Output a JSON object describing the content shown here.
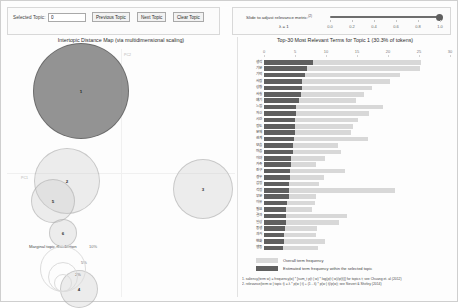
{
  "toolbar": {
    "selected_topic_label": "Selected Topic:",
    "selected_topic_value": "0",
    "previous_topic": "Previous Topic",
    "next_topic": "Next Topic",
    "clear_topic": "Clear Topic"
  },
  "slider": {
    "label": "Slide to adjust relevance metric:",
    "label_sup": "(2)",
    "lambda_text": "λ = 1",
    "value": 1.0,
    "min": 0.0,
    "max": 1.0,
    "ticks": [
      "0.0",
      "0.2",
      "0.4",
      "0.6",
      "0.8",
      "1.0"
    ]
  },
  "left_panel": {
    "title": "Intertopic Distance Map (via multidimensional scaling)",
    "axis_labels": {
      "pc1": "PC1",
      "pc2": "PC2"
    },
    "marginal_legend": {
      "title": "Marginal topic distribution",
      "sizes": [
        "2%",
        "5%",
        "10%"
      ]
    },
    "topics": [
      {
        "id": "1",
        "x": 74,
        "y": 42,
        "r": 48,
        "selected": true
      },
      {
        "id": "2",
        "x": 60,
        "y": 132,
        "r": 33,
        "selected": false
      },
      {
        "id": "3",
        "x": 196,
        "y": 140,
        "r": 30,
        "selected": false
      },
      {
        "id": "5",
        "x": 46,
        "y": 152,
        "r": 22,
        "selected": false
      },
      {
        "id": "6",
        "x": 56,
        "y": 184,
        "r": 14,
        "selected": false
      },
      {
        "id": "4",
        "x": 72,
        "y": 240,
        "r": 19,
        "selected": false
      }
    ]
  },
  "right_panel": {
    "title": "Top-30 Most Relevant Terms for Topic 1 (30.3% of tokens)",
    "topic_number": 1,
    "token_share": "30.3%",
    "legend": {
      "overall": "Overall term frequency",
      "within": "Estimated term frequency within the selected topic"
    },
    "notes": [
      "1. saliency(term w) = frequency(w) * [sum_t p(t | w) * log(p(t | w)/p(t))] for topics t; see Chuang et. al (2012)",
      "2. relevance(term w | topic t) = λ * p(w | t) + (1 - λ) * p(w | t)/p(w); see Sievert & Shirley (2014)"
    ]
  },
  "chart_data": {
    "type": "bar",
    "title": "Top-30 Most Relevant Terms for Topic 1 (30.3% of tokens)",
    "xlabel": "",
    "ylabel": "",
    "xlim": [
      0,
      30
    ],
    "grid": false,
    "legend_position": "bottom",
    "orientation": "horizontal",
    "ticks": [
      0,
      5,
      10,
      15,
      20,
      25,
      30
    ],
    "categories": [
      "생각",
      "기분",
      "기억",
      "사람",
      "상황",
      "사실",
      "얘기",
      "느낌",
      "자신",
      "시간",
      "정도",
      "문제",
      "관계",
      "모습",
      "마음",
      "이야",
      "가족",
      "친구",
      "경우",
      "감정",
      "걱정",
      "부분",
      "이유",
      "필요",
      "결과",
      "일상",
      "동생",
      "과거",
      "변화",
      "행동"
    ],
    "series": [
      {
        "name": "Overall term frequency",
        "values": [
          25.4,
          25.1,
          21.9,
          20.3,
          17.4,
          16.1,
          14.8,
          19.2,
          16.9,
          15.1,
          14.3,
          14.1,
          16.8,
          11.9,
          12.4,
          9.9,
          8.4,
          13.1,
          9.6,
          8.9,
          21.2,
          8.4,
          8.3,
          7.8,
          13.4,
          12.1,
          8.6,
          8.4,
          9.8,
          8.7
        ]
      },
      {
        "name": "Estimated term frequency within the selected topic",
        "values": [
          7.9,
          7.0,
          6.6,
          6.2,
          6.1,
          5.9,
          5.6,
          5.2,
          5.1,
          5.0,
          5.0,
          5.0,
          4.9,
          4.7,
          4.6,
          4.4,
          4.3,
          4.2,
          4.2,
          4.1,
          4.1,
          4.0,
          3.7,
          3.6,
          3.5,
          3.5,
          3.4,
          3.3,
          3.2,
          3.1
        ]
      }
    ]
  },
  "colors": {
    "bar_overall": "#d8d8d8",
    "bar_within": "#5f5f5f",
    "bubble_fill": "rgba(200,200,200,0.30)",
    "bubble_selected": "rgba(128,128,128,0.85)"
  }
}
